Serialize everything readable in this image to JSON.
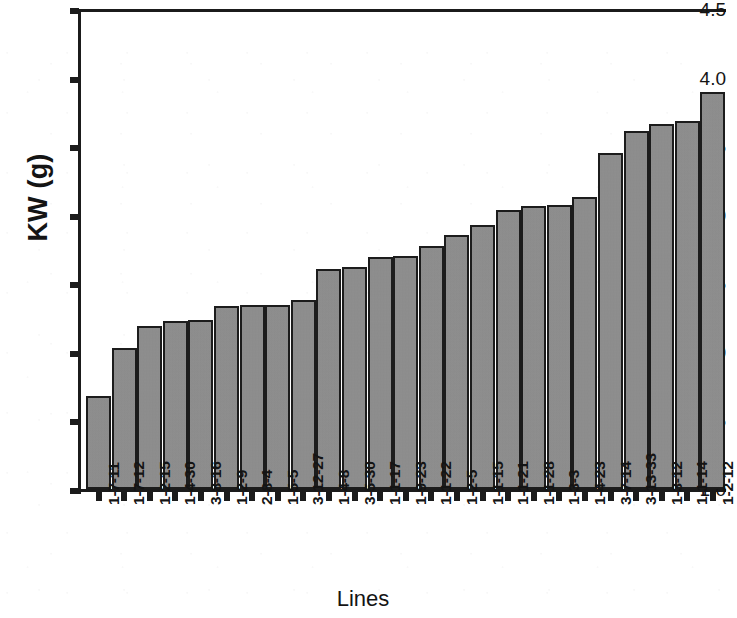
{
  "chart_data": {
    "type": "bar",
    "title": "",
    "xlabel": "Lines",
    "ylabel": "KW (g)",
    "ylim": [
      1.0,
      4.5
    ],
    "yticks": [
      "1.0",
      "1.5",
      "2.0",
      "2.5",
      "3.0",
      "3.5",
      "4.0",
      "4.5"
    ],
    "ytick_values": [
      1.0,
      1.5,
      2.0,
      2.5,
      3.0,
      3.5,
      4.0,
      4.5
    ],
    "grid": false,
    "legend": null,
    "bar_color": "#8e8e8e",
    "bar_edge_color": "#1c1c1c",
    "axis_color": "#1b1b1b",
    "categories": [
      "1-7-11",
      "1-7-12",
      "1-2-15",
      "1-4-30",
      "3-8-16",
      "1-2-9",
      "2-8-4",
      "1-5-5",
      "3-12-27",
      "1-4-8",
      "3-5-30",
      "1-1-17",
      "1-9-23",
      "1-1-22",
      "1-2-5",
      "1-1-15",
      "1-1-21",
      "1-1-28",
      "1-3-3",
      "1-4-23",
      "3-7-14",
      "3-13-33",
      "1-3-12",
      "1-1-14",
      "1-2-12"
    ],
    "values": [
      1.66,
      2.01,
      2.17,
      2.2,
      2.21,
      2.31,
      2.32,
      2.32,
      2.36,
      2.58,
      2.6,
      2.67,
      2.68,
      2.75,
      2.83,
      2.9,
      3.01,
      3.04,
      3.05,
      3.11,
      3.43,
      3.59,
      3.64,
      3.66,
      3.87
    ]
  }
}
